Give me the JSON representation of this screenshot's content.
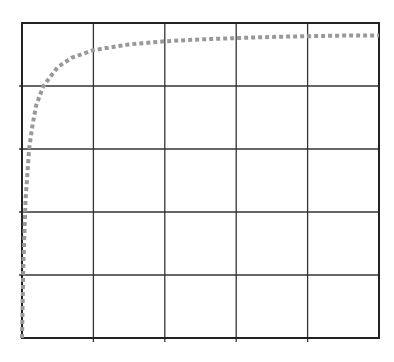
{
  "chart_data": {
    "type": "line",
    "title": "",
    "xlabel": "",
    "ylabel": "",
    "xlim": [
      0,
      5
    ],
    "ylim": [
      0,
      5
    ],
    "grid": true,
    "legend": null,
    "series": [
      {
        "name": "saturation-curve",
        "style": "dotted",
        "color": "#999999",
        "x": [
          0,
          0.02,
          0.05,
          0.1,
          0.15,
          0.2,
          0.3,
          0.4,
          0.5,
          0.7,
          1.0,
          1.5,
          2.0,
          2.5,
          3.0,
          3.5,
          4.0,
          4.5,
          5.0
        ],
        "y": [
          0,
          1.2,
          2.2,
          3.0,
          3.4,
          3.7,
          4.0,
          4.15,
          4.3,
          4.45,
          4.57,
          4.66,
          4.71,
          4.74,
          4.76,
          4.78,
          4.79,
          4.8,
          4.8
        ]
      }
    ]
  },
  "colors": {
    "grid": "#333333",
    "frame": "#222222",
    "curve": "#999999",
    "background": "#ffffff"
  }
}
